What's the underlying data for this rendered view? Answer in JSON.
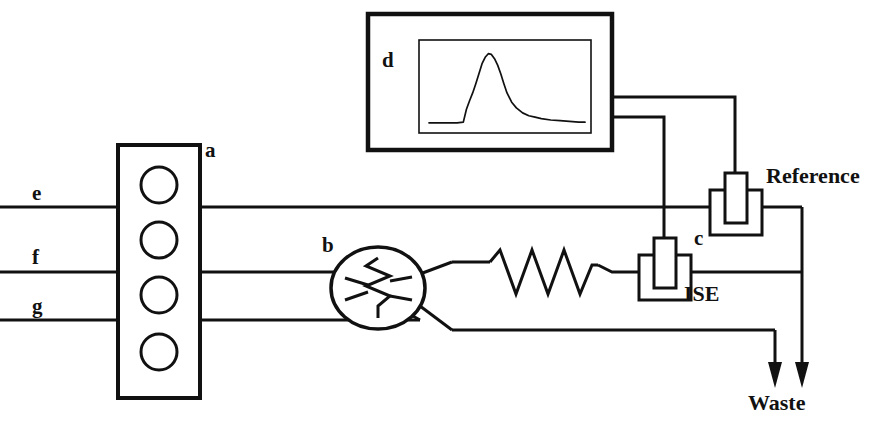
{
  "figure": {
    "kind": "flow-injection-analysis-schematic",
    "width": 875,
    "height": 421,
    "background_color": "#ffffff",
    "line_color": "#111111"
  },
  "labels": {
    "pump": "a",
    "injection_valve": "b",
    "electrode_pair": "c",
    "detector": "d",
    "line_e": "e",
    "line_f": "f",
    "line_g": "g",
    "ise_electrode": "ISE",
    "reference_electrode": "Reference",
    "waste": "Waste"
  },
  "components": {
    "peristaltic_pump": {
      "name": "a",
      "box": {
        "x": 118,
        "y": 145,
        "width": 82,
        "height": 253
      },
      "roller_count": 4,
      "roller_radius": 18,
      "roller_centers_y": [
        185,
        240,
        295,
        352
      ],
      "roller_center_x": 159
    },
    "injection_valve": {
      "name": "b",
      "center": {
        "x": 378,
        "y": 288
      },
      "radius_x": 47,
      "radius_y": 41,
      "rotor_symbol": "vertical-zigzag"
    },
    "reaction_coil": {
      "shape": "zigzag",
      "start_x": 490,
      "end_x": 598,
      "baseline_y": 272,
      "amplitude": 22,
      "peaks": 4
    },
    "ise_electrode": {
      "name": "ISE",
      "outer_box": {
        "x": 639,
        "y": 255,
        "width": 52,
        "height": 45
      },
      "inner_box": {
        "x": 654,
        "y": 238,
        "width": 22,
        "height": 50
      },
      "lead_x": 664,
      "on_line": "f"
    },
    "reference_electrode": {
      "name": "Reference",
      "outer_box": {
        "x": 710,
        "y": 190,
        "width": 52,
        "height": 45
      },
      "inner_box": {
        "x": 725,
        "y": 173,
        "width": 22,
        "height": 50
      },
      "lead_x": 735,
      "on_line": "e"
    },
    "detector": {
      "name": "d",
      "outer_box": {
        "x": 368,
        "y": 14,
        "width": 244,
        "height": 136
      },
      "screen_box": {
        "x": 419,
        "y": 40,
        "width": 172,
        "height": 93
      },
      "wire_out_upper_y": 97,
      "wire_out_lower_y": 117
    },
    "waste": {
      "label": "Waste",
      "arrow_x": [
        775,
        802
      ],
      "arrow_tip_y": 385
    }
  },
  "flow_lines": {
    "e": {
      "y": 207,
      "from_x": 0,
      "to_x": 802,
      "description": "carrier line through Reference electrode to waste"
    },
    "f": {
      "y": 272,
      "from_x": 0,
      "to_x": 802,
      "description": "sample line through valve, reaction coil and ISE to waste"
    },
    "g": {
      "y": 320,
      "from_x": 0,
      "to_x": 775,
      "description": "carrier line through valve to waste"
    }
  },
  "chart_data": {
    "type": "line",
    "title": "",
    "subtitle": "",
    "xlabel": "",
    "ylabel": "",
    "legend": [],
    "grid": false,
    "axis_visible": false,
    "annotation": "FIA transient peak: sharp leading edge, maximum, exponential tail",
    "x": [
      0.0,
      0.06,
      0.12,
      0.18,
      0.22,
      0.24,
      0.26,
      0.28,
      0.3,
      0.32,
      0.34,
      0.36,
      0.38,
      0.4,
      0.42,
      0.44,
      0.46,
      0.48,
      0.5,
      0.53,
      0.56,
      0.6,
      0.64,
      0.68,
      0.72,
      0.78,
      0.84,
      0.9,
      0.96,
      1.0
    ],
    "y": [
      0.03,
      0.03,
      0.03,
      0.03,
      0.04,
      0.22,
      0.34,
      0.45,
      0.58,
      0.72,
      0.86,
      0.95,
      1.0,
      0.99,
      0.93,
      0.84,
      0.72,
      0.58,
      0.45,
      0.32,
      0.24,
      0.17,
      0.13,
      0.11,
      0.09,
      0.07,
      0.06,
      0.05,
      0.04,
      0.04
    ],
    "xlim": [
      0,
      1
    ],
    "ylim": [
      0,
      1.08
    ]
  }
}
